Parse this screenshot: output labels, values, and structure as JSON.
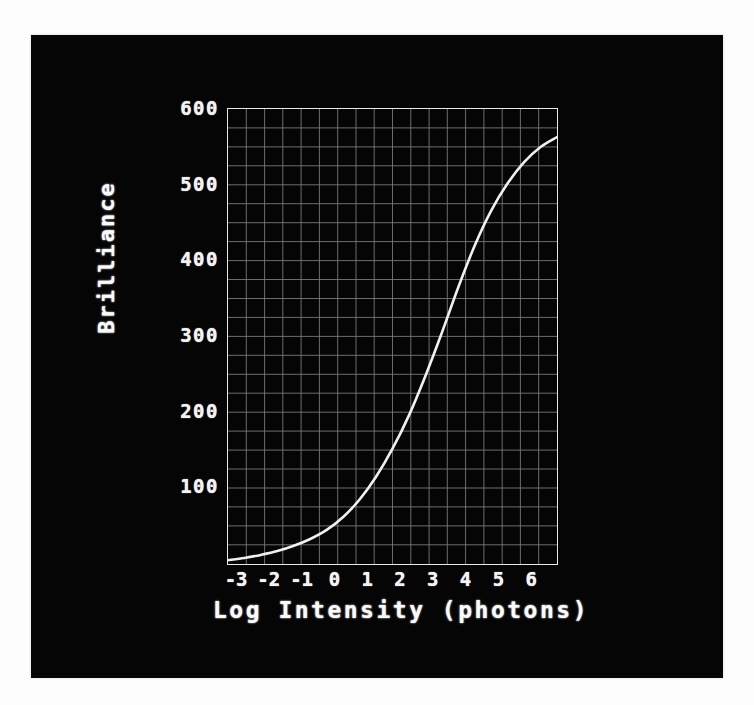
{
  "figure": {
    "background_color": "#050505",
    "ink_color": "#f2f2f2",
    "grid_color": "#9a9a9a"
  },
  "chart_data": {
    "type": "line",
    "title": "",
    "xlabel": "Log Intensity (photons)",
    "ylabel": "Brilliance",
    "xlim": [
      -3.5,
      6.5
    ],
    "ylim": [
      0,
      600
    ],
    "xticks": [
      -3,
      -2,
      -1,
      0,
      1,
      2,
      3,
      4,
      5,
      6
    ],
    "xticklabels": [
      "-3",
      "-2",
      "-1",
      "0",
      "1",
      "2",
      "3",
      "4",
      "5",
      "6"
    ],
    "yticks": [
      100,
      200,
      300,
      400,
      500,
      600
    ],
    "yticklabels": [
      "100",
      "200",
      "300",
      "400",
      "500",
      "600"
    ],
    "grid": true,
    "grid_minor": true,
    "legend": "none",
    "series": [
      {
        "name": "Brilliance vs Log Intensity",
        "color": "#f0f0f0",
        "x": [
          -3.5,
          -3.0,
          -2.5,
          -2.0,
          -1.5,
          -1.0,
          -0.5,
          0.0,
          0.5,
          1.0,
          1.5,
          2.0,
          2.5,
          3.0,
          3.5,
          4.0,
          4.5,
          5.0,
          5.5,
          6.0,
          6.5
        ],
        "y": [
          5,
          8,
          12,
          17,
          24,
          33,
          45,
          62,
          85,
          115,
          152,
          196,
          248,
          305,
          365,
          420,
          466,
          502,
          530,
          550,
          563
        ]
      }
    ]
  },
  "axis_labels": {
    "x": "Log  Intensity  (photons)",
    "y": "Brilliance"
  }
}
